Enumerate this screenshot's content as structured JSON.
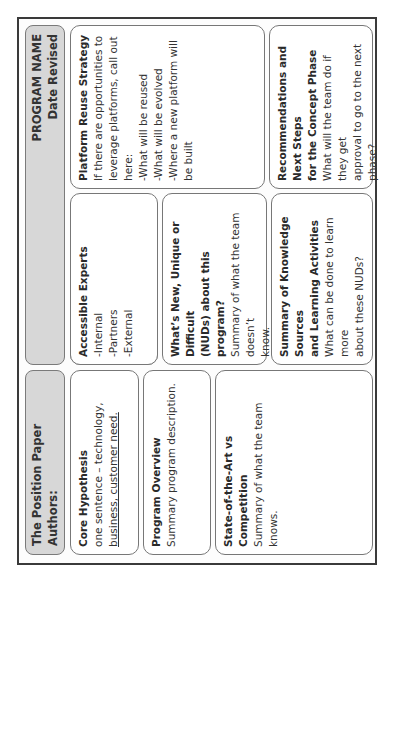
{
  "header": {
    "title": "The Position Paper",
    "authors_label": "Authors:",
    "program_name": "PROGRAM NAME",
    "date_revised": "Date Revised"
  },
  "cards": {
    "core_hypothesis": {
      "title": "Core Hypothesis",
      "lines": [
        "one sentence – technology,",
        "business, customer need."
      ]
    },
    "program_overview": {
      "title": "Program Overview",
      "lines": [
        "Summary program description."
      ]
    },
    "state_of_art": {
      "title_lines": [
        "State-of-the-Art vs",
        "Competition"
      ],
      "lines": [
        "Summary of what the team",
        "knows."
      ]
    },
    "accessible_experts": {
      "title": "Accessible Experts",
      "lines": [
        "-Internal",
        "-Partners",
        "-External"
      ]
    },
    "whats_new": {
      "title_lines": [
        "What’s New, Unique or Difficult",
        "(NUDs) about this program?"
      ],
      "lines": [
        "Summary of what the team doesn’t",
        "know."
      ]
    },
    "knowledge_sources": {
      "title_lines": [
        "Summary of Knowledge Sources",
        "and Learning Activities"
      ],
      "lines": [
        "What can be done to learn more",
        "about these NUDs?"
      ]
    },
    "platform_reuse": {
      "title": "Platform Reuse Strategy",
      "lines": [
        "If there are opportunities to",
        "leverage platforms, call out here:",
        "-What will be reused",
        "-What will be evolved",
        "-Where a new platform will be built"
      ]
    },
    "recommendations": {
      "title_lines": [
        "Recommendations and Next Steps",
        "for the Concept Phase"
      ],
      "lines": [
        "What will the team do if they get",
        "approval to go to the next phase?"
      ]
    }
  }
}
